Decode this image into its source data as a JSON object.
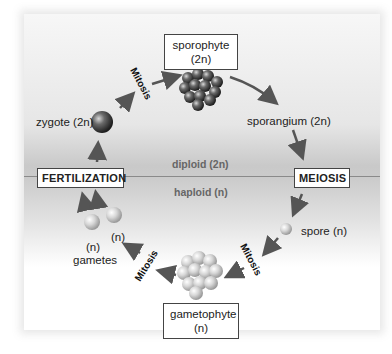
{
  "diagram": {
    "regions": {
      "upper": "diploid (2n)",
      "lower": "haploid (n)"
    },
    "stages": {
      "sporophyte": {
        "line1": "sporophyte",
        "line2": "(2n)"
      },
      "sporangium": "sporangium (2n)",
      "meiosis": "MEIOSIS",
      "spore": "spore (n)",
      "gametophyte": {
        "line1": "gametophyte",
        "line2": "(n)"
      },
      "gametes": {
        "n_right": "(n)",
        "n_left": "(n)",
        "label": "gametes"
      },
      "fertilization": "FERTILIZATION",
      "zygote": "zygote (2n)"
    },
    "process_labels": {
      "mitosis_top": "Mitosis",
      "mitosis_bottom": "Mitosis"
    },
    "colors": {
      "arrow": "#555555",
      "box_border": "#444444",
      "divider": "#8a8a8a"
    }
  }
}
